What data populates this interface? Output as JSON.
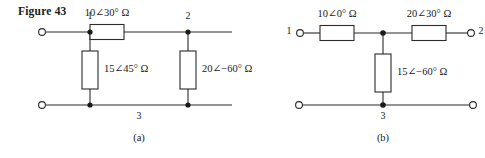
{
  "figure": {
    "title": "Figure 43",
    "subfigures": [
      {
        "caption": "(a)",
        "nodes": [
          {
            "id": "1",
            "label": "1"
          },
          {
            "id": "2",
            "label": "2"
          },
          {
            "id": "3",
            "label": "3"
          }
        ],
        "components": [
          {
            "id": "a-series-z",
            "label": "10∠30° Ω",
            "orientation": "horizontal"
          },
          {
            "id": "a-shunt-left-z",
            "label": "15∠45° Ω",
            "orientation": "vertical"
          },
          {
            "id": "a-shunt-right-z",
            "label": "20∠−60° Ω",
            "orientation": "vertical"
          }
        ]
      },
      {
        "caption": "(b)",
        "nodes": [
          {
            "id": "1",
            "label": "1"
          },
          {
            "id": "2",
            "label": "2"
          },
          {
            "id": "3",
            "label": "3"
          }
        ],
        "components": [
          {
            "id": "b-series-left-z",
            "label": "10∠0° Ω",
            "orientation": "horizontal"
          },
          {
            "id": "b-series-right-z",
            "label": "20∠30° Ω",
            "orientation": "horizontal"
          },
          {
            "id": "b-shunt-z",
            "label": "15∠−60° Ω",
            "orientation": "vertical"
          }
        ]
      }
    ],
    "colors": {
      "ink": "#1a1a1a",
      "line": "#2b2b2b",
      "background": "#ffffff"
    }
  }
}
